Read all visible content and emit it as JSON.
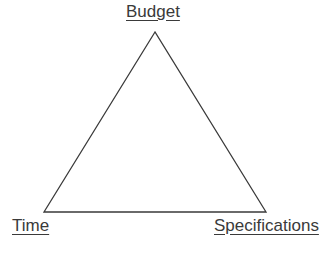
{
  "diagram": {
    "type": "project-management-triangle",
    "vertices": {
      "top": {
        "label": "Budget"
      },
      "bottom_left": {
        "label": "Time"
      },
      "bottom_right": {
        "label": "Specifications"
      }
    },
    "line_color": "#3a3a3a"
  }
}
